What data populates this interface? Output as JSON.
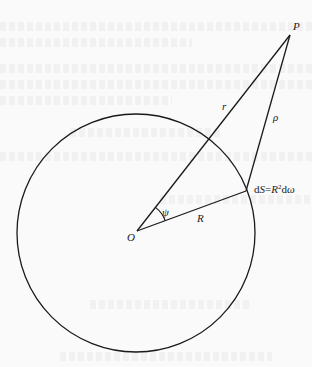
{
  "figure": {
    "type": "geometry-diagram",
    "stroke_color": "#1a1a1a",
    "background_color": "#fafafa"
  },
  "points": {
    "O": {
      "label": "O",
      "x": 137,
      "y": 231
    },
    "P": {
      "label": "P",
      "x": 290,
      "y": 35
    },
    "dS": {
      "label_parts": [
        "d",
        "S",
        "=",
        "R",
        "2",
        "d",
        "ω"
      ],
      "x": 246,
      "y": 191
    }
  },
  "segments": {
    "r": {
      "label": "r",
      "from": "O",
      "to": "P"
    },
    "rho": {
      "label": "ρ",
      "from": "dS",
      "to": "P"
    },
    "R": {
      "label": "R",
      "from": "O",
      "to": "dS"
    }
  },
  "angle": {
    "label": "ψ",
    "vertex": "O",
    "between": [
      "r",
      "R"
    ]
  },
  "circle": {
    "cx": 136,
    "cy": 233,
    "r": 119
  },
  "labels": {
    "P": "P",
    "O": "O",
    "r": "r",
    "rho": "ρ",
    "R": "R",
    "psi": "ψ",
    "dS_d": "d",
    "dS_S": "S",
    "dS_eq": "=",
    "dS_R": "R",
    "dS_exp": "2",
    "dS_d2": "d",
    "dS_omega": "ω"
  }
}
